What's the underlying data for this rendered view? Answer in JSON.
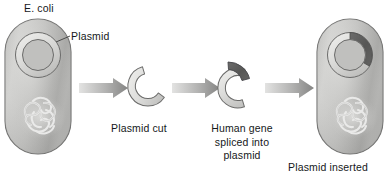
{
  "diagram": {
    "width": 388,
    "height": 179,
    "background_color": "#ffffff",
    "labels": {
      "ecoli": "E. coli",
      "plasmid": "Plasmid",
      "plasmid_cut": "Plasmid cut",
      "human_gene_line1": "Human gene",
      "human_gene_line2": "spliced into",
      "human_gene_line3": "plasmid",
      "plasmid_inserted": "Plasmid inserted"
    },
    "colors": {
      "cell_fill_light": "#d0d0cf",
      "cell_fill_mid": "#b4b4b3",
      "cell_fill_dark": "#9a9a99",
      "cell_outline": "#6f6f6e",
      "plasmid_ring_light": "#e4e4e3",
      "plasmid_ring_mid": "#c6c6c5",
      "plasmid_outline": "#6b6b6a",
      "human_gene_dark": "#5c5c5b",
      "arrow_light": "#dcdcdb",
      "arrow_dark": "#8d8d8c",
      "dna_stroke": "#e8e8e6",
      "text": "#15181a",
      "leader_line": "#4c4c4b"
    },
    "stages": [
      {
        "id": "stage-ecoli-with-plasmid",
        "name": "E. coli cell containing plasmid",
        "label": "E. coli",
        "sublabel": "Plasmid",
        "contains_human_gene": false
      },
      {
        "id": "stage-plasmid-cut",
        "name": "Cut open plasmid",
        "label": "Plasmid cut",
        "contains_human_gene": false
      },
      {
        "id": "stage-gene-spliced",
        "name": "Plasmid with human gene being spliced in",
        "label": "Human gene spliced into plasmid",
        "contains_human_gene": true
      },
      {
        "id": "stage-plasmid-inserted",
        "name": "E. coli cell with recombinant plasmid",
        "label": "Plasmid inserted",
        "contains_human_gene": true
      }
    ],
    "arrows": [
      {
        "id": "arrow-1",
        "from": "stage-ecoli-with-plasmid",
        "to": "stage-plasmid-cut"
      },
      {
        "id": "arrow-2",
        "from": "stage-plasmid-cut",
        "to": "stage-gene-spliced"
      },
      {
        "id": "arrow-3",
        "from": "stage-gene-spliced",
        "to": "stage-plasmid-inserted"
      }
    ]
  }
}
